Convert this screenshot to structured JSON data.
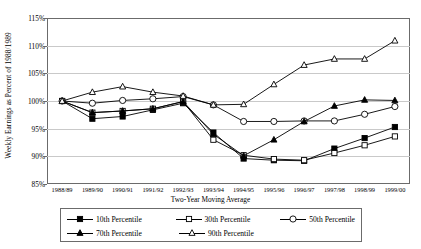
{
  "chart_data": {
    "type": "line",
    "title": "",
    "ylabel": "Weekly Earnings as Percent of 1988/1989",
    "xlabel": "Two-Year Moving Average",
    "ylim": [
      85,
      115
    ],
    "ytick_values": [
      85,
      90,
      95,
      100,
      105,
      110,
      115
    ],
    "ytick_labels": [
      "85%",
      "90%",
      "95%",
      "100%",
      "105%",
      "110%",
      "115%"
    ],
    "grid": true,
    "legend_position": "bottom",
    "categories": [
      "1988/89",
      "1989/90",
      "1990/91",
      "1991/92",
      "1992/93",
      "1993/94",
      "1994/95",
      "1995/96",
      "1996/97",
      "1997/98",
      "1998/99",
      "1999/00"
    ],
    "series": [
      {
        "name": "10th Percentile",
        "marker": "filled-square",
        "values": [
          100.0,
          96.8,
          97.2,
          98.4,
          99.6,
          94.3,
          89.6,
          89.3,
          89.2,
          91.4,
          93.3,
          95.3
        ]
      },
      {
        "name": "30th Percentile",
        "marker": "open-square",
        "values": [
          100.0,
          97.9,
          98.2,
          98.6,
          99.9,
          93.0,
          90.2,
          89.5,
          89.3,
          90.6,
          92.0,
          93.6
        ]
      },
      {
        "name": "50th Percentile",
        "marker": "open-circle",
        "values": [
          100.0,
          99.6,
          100.1,
          100.4,
          100.8,
          99.3,
          96.3,
          96.3,
          96.4,
          96.4,
          97.6,
          99.0
        ]
      },
      {
        "name": "70th Percentile",
        "marker": "filled-triangle",
        "values": [
          100.0,
          97.9,
          98.2,
          98.6,
          99.9,
          94.0,
          90.1,
          93.0,
          96.3,
          99.1,
          100.2,
          100.1
        ]
      },
      {
        "name": "90th Percentile",
        "marker": "open-triangle",
        "values": [
          100.0,
          101.6,
          102.6,
          101.6,
          100.9,
          99.3,
          99.4,
          103.0,
          106.5,
          107.6,
          107.6,
          110.9
        ]
      }
    ]
  },
  "legend": {
    "items": [
      {
        "label": "10th Percentile",
        "marker": "filled-square"
      },
      {
        "label": "30th Percentile",
        "marker": "open-square"
      },
      {
        "label": "50th Percentile",
        "marker": "open-circle"
      },
      {
        "label": "70th Percentile",
        "marker": "filled-triangle"
      },
      {
        "label": "90th Percentile",
        "marker": "open-triangle"
      }
    ]
  }
}
